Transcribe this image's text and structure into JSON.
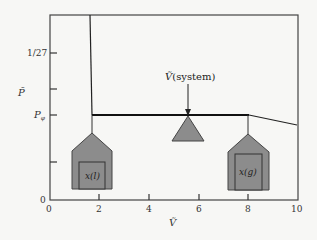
{
  "diagram": {
    "type": "lever-rule phase diagram",
    "x_axis": {
      "label": "Ṽ",
      "ticks": [
        "0",
        "2",
        "4",
        "6",
        "8",
        "10"
      ],
      "range": [
        0,
        10
      ]
    },
    "y_axis": {
      "label": "P̃",
      "ticks": [
        {
          "label": "1/27"
        },
        {
          "label": ""
        },
        {
          "label": "P_φ",
          "text": "P",
          "subscript": "φ"
        },
        {
          "label": ""
        }
      ],
      "origin_label": "0"
    },
    "annotation": {
      "text": "Ṽ",
      "suffix": "(system)"
    },
    "liquid_house": {
      "label": "x(l)"
    },
    "gas_house": {
      "label": "x(g)"
    },
    "colors": {
      "fill": "#8c8c8c",
      "stroke": "#333333",
      "background": "#f7f7f5"
    }
  }
}
